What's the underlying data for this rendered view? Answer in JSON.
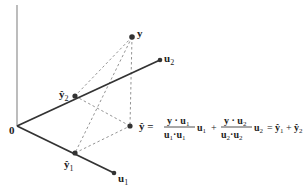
{
  "diagram": {
    "labels": {
      "origin": "0",
      "y": "y",
      "u1": "u",
      "u1_sub": "1",
      "u2": "u",
      "u2_sub": "2",
      "yhat": "ŷ",
      "yhat1": "ŷ",
      "yhat1_sub": "1",
      "yhat2": "ŷ",
      "yhat2_sub": "2"
    },
    "points": {
      "origin": [
        17,
        126
      ],
      "y": [
        132,
        37
      ],
      "u1": [
        114,
        173
      ],
      "u2": [
        160,
        60
      ],
      "yhat": [
        130,
        126
      ],
      "yhat1": [
        75,
        153
      ],
      "yhat2": [
        75,
        96
      ]
    },
    "equation": {
      "lhs": "ŷ =",
      "frac1_num": "y · u",
      "frac1_num_sub": "1",
      "frac1_den_a": "u",
      "frac1_den_a_sub": "1",
      "frac1_den_dot": "·",
      "frac1_den_b": "u",
      "frac1_den_b_sub": "1",
      "term1_vec": "u",
      "term1_vec_sub": "1",
      "plus1": "+",
      "frac2_num": "y · u",
      "frac2_num_sub": "2",
      "frac2_den_a": "u",
      "frac2_den_a_sub": "2",
      "frac2_den_dot": "·",
      "frac2_den_b": "u",
      "frac2_den_b_sub": "2",
      "term2_vec": "u",
      "term2_vec_sub": "2",
      "equals": "=",
      "rhs_a": "ŷ",
      "rhs_a_sub": "1",
      "plus2": "+",
      "rhs_b": "ŷ",
      "rhs_b_sub": "2"
    },
    "colors": {
      "axis": "#999999",
      "vector": "#333333",
      "dashed": "#888888",
      "point": "#333333",
      "text": "#222222"
    }
  }
}
